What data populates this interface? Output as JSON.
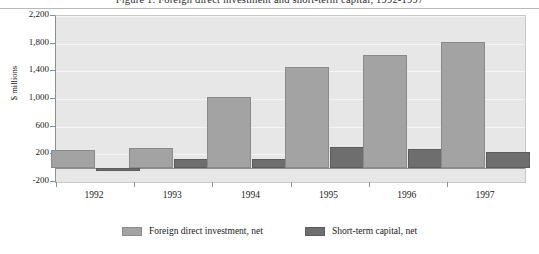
{
  "chart_data": {
    "type": "bar",
    "title": "Figure 1.  Foreign direct investment and short-term capital, 1992-1997",
    "xlabel": "",
    "ylabel": "$ millions",
    "categories": [
      "1992",
      "1993",
      "1994",
      "1995",
      "1996",
      "1997"
    ],
    "series": [
      {
        "name": "Foreign direct investment, net",
        "color": "#a3a3a3",
        "values": [
          260,
          290,
          1030,
          1460,
          1640,
          1830
        ]
      },
      {
        "name": "Short-term capital, net",
        "color": "#6e6e6e",
        "values": [
          -40,
          130,
          130,
          300,
          280,
          230
        ]
      }
    ],
    "ylim": [
      -200,
      2200
    ],
    "yticks": [
      -200,
      200,
      600,
      1000,
      1400,
      1800,
      2200
    ],
    "ytick_labels": [
      "-200",
      "200",
      "600",
      "1,000",
      "1,400",
      "1,800",
      "2,200"
    ],
    "grid": true,
    "legend_position": "bottom",
    "plot_background": "#e7e7e7"
  },
  "legend": {
    "items": [
      {
        "label": "Foreign direct investment, net"
      },
      {
        "label": "Short-term capital, net"
      }
    ]
  }
}
